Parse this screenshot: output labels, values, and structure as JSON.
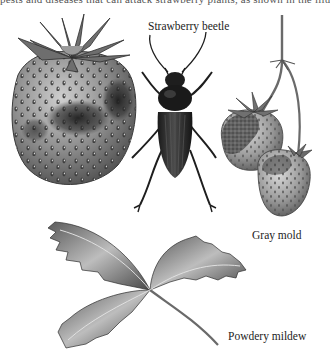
{
  "figure": {
    "top_text_cutoff": "pests and diseases that can attack strawberry plants, as shown in the illustration.",
    "labels": {
      "beetle": "Strawberry beetle",
      "gray_mold": "Gray mold",
      "powdery_mildew": "Powdery mildew"
    },
    "palette": {
      "background": "#ffffff",
      "ink": "#1c1c1c",
      "fruit_mid": "#8a8a8a",
      "fruit_dark": "#3a3a3a",
      "leaf_light": "#c8c8c8",
      "leaf_dark": "#4a4a4a"
    }
  }
}
